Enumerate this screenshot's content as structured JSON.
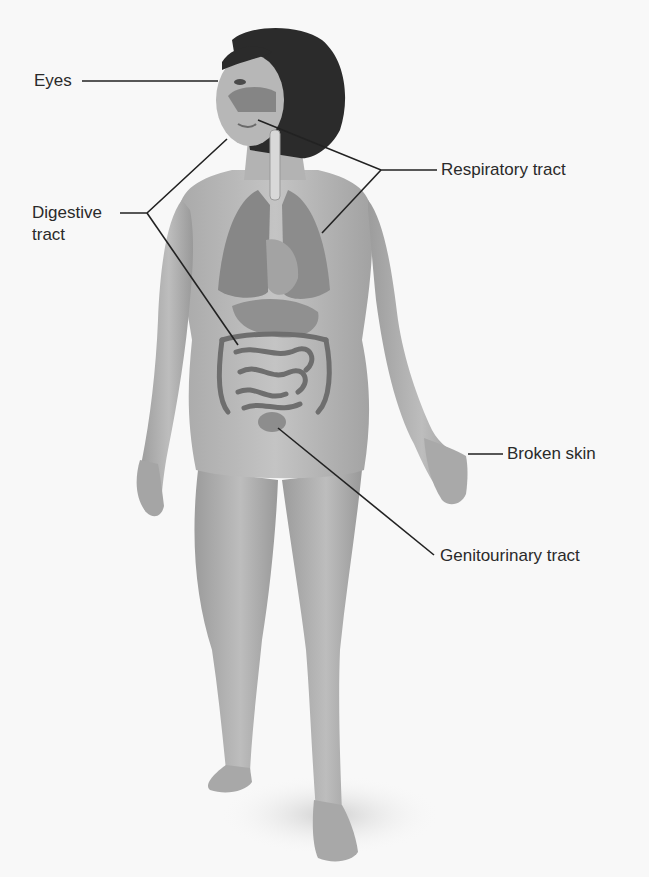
{
  "diagram": {
    "colors": {
      "background": "#f8f8f8",
      "skin": "#b9b9b9",
      "skin_shadow": "#8f8f8f",
      "hair": "#2b2b2b",
      "organ": "#8a8a8a",
      "organ_dark": "#6a6a6a",
      "leader_line": "#222222",
      "label_text": "#2a2a2a"
    },
    "labels": [
      {
        "id": "eyes",
        "text": "Eyes",
        "x": 34,
        "y": 70
      },
      {
        "id": "respiratory",
        "text": "Respiratory tract",
        "x": 441,
        "y": 159
      },
      {
        "id": "digestive",
        "text": "Digestive tract",
        "x": 32,
        "y": 203
      },
      {
        "id": "broken-skin",
        "text": "Broken skin",
        "x": 507,
        "y": 443
      },
      {
        "id": "genitourinary",
        "text": "Genitourinary tract",
        "x": 440,
        "y": 546
      }
    ],
    "leader_lines": {
      "eyes": [
        [
          82,
          81
        ],
        [
          218,
          81
        ]
      ],
      "respiratory": [
        [
          437,
          170
        ],
        [
          381,
          170
        ],
        [
          258,
          120
        ],
        [
          381,
          170
        ],
        [
          322,
          233
        ]
      ],
      "digestive": [
        [
          120,
          213
        ],
        [
          147,
          213
        ],
        [
          227,
          139
        ],
        [
          147,
          213
        ],
        [
          238,
          345
        ]
      ],
      "broken_skin": [
        [
          468,
          454
        ],
        [
          503,
          454
        ]
      ],
      "genitourinary": [
        [
          434,
          555
        ],
        [
          278,
          428
        ]
      ]
    }
  }
}
